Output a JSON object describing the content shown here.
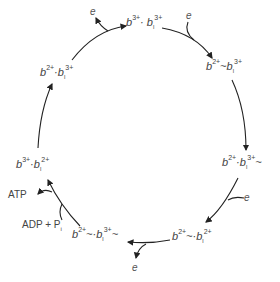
{
  "diagram": {
    "type": "reaction-cycle",
    "states": [
      {
        "id": "top",
        "base": "b",
        "base_charge": "3+",
        "dot": "·",
        "second": "b",
        "second_sub": "l",
        "second_charge": "3+",
        "tilde_left": "",
        "tilde_right": ""
      },
      {
        "id": "upper-right",
        "base": "b",
        "base_charge": "2+",
        "sep": "~",
        "second": "b",
        "second_sub": "l",
        "second_charge": "3+"
      },
      {
        "id": "right",
        "base": "b",
        "base_charge": "2+",
        "sep": "·",
        "second": "b",
        "second_sub": "l",
        "second_charge": "3+",
        "suffix": "~"
      },
      {
        "id": "lower-right",
        "base": "b",
        "base_charge": "2+",
        "sep": "~·",
        "second": "b",
        "second_sub": "l",
        "second_charge": "2+"
      },
      {
        "id": "bottom-left",
        "base": "b",
        "base_charge": "2+",
        "sep": "~·",
        "second": "b",
        "second_sub": "l",
        "second_charge": "3+",
        "suffix": "~"
      },
      {
        "id": "left",
        "base": "b",
        "base_charge": "3+",
        "sep": "·",
        "second": "b",
        "second_sub": "l",
        "second_charge": "2+"
      },
      {
        "id": "upper-left",
        "base": "b",
        "base_charge": "2+",
        "sep": "·",
        "second": "b",
        "second_sub": "l",
        "second_charge": "3+"
      }
    ],
    "side_labels": {
      "electron": "e",
      "atp": "ATP",
      "adp_pi": "ADP + P",
      "pi_sub": "i"
    }
  }
}
